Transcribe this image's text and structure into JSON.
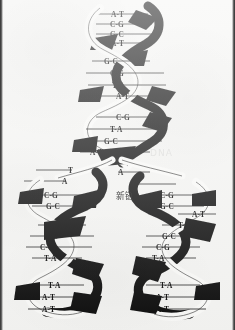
{
  "figure": {
    "kind": "scanned-illustration",
    "background_color": "#f5f5f3",
    "ink_color": "#0d0d0d",
    "strand_light_color": "#fbfbf9",
    "labels": {
      "new_strand": "新链",
      "watermark": "DNA"
    }
  },
  "helix": {
    "parent": {
      "name": "parent-duplex",
      "segments": [
        {
          "name": "parent-segment-1",
          "pairs": [
            "A-T",
            "C-G",
            "G-C",
            "A-T"
          ]
        },
        {
          "name": "parent-segment-2",
          "pairs": [
            "G-C",
            "C-G",
            "T-A",
            "A-T"
          ]
        },
        {
          "name": "parent-segment-3",
          "pairs": [
            "C-G",
            "T-A",
            "G-C",
            "A-T"
          ]
        }
      ]
    },
    "fork": {
      "name": "replication-fork",
      "unpaired_left": [
        "T",
        "A"
      ],
      "unpaired_right": [
        "A",
        "T"
      ]
    },
    "daughter_left": {
      "name": "daughter-duplex-left",
      "segments": [
        {
          "name": "left-segment-1",
          "pairs": [
            "C-G",
            "G-C"
          ]
        },
        {
          "name": "left-segment-2",
          "pairs": [
            "T-A",
            "G-C",
            "C-G",
            "T-A"
          ]
        },
        {
          "name": "left-segment-3",
          "pairs": [
            "T-A",
            "A-T",
            "A-T"
          ]
        }
      ]
    },
    "daughter_right": {
      "name": "daughter-duplex-right",
      "segments": [
        {
          "name": "right-segment-1",
          "pairs": [
            "C-G",
            "G-C"
          ]
        },
        {
          "name": "right-segment-2",
          "pairs": [
            "A-T",
            "T-A",
            "G-C",
            "C-G",
            "T-A"
          ]
        },
        {
          "name": "right-segment-3",
          "pairs": [
            "T-A",
            "A-T",
            "A-T"
          ]
        }
      ]
    }
  },
  "bases": {
    "p_s1_0": "A-T",
    "p_s1_1": "C-G",
    "p_s1_2": "G-C",
    "p_s1_3": "A-T",
    "p_s2_0": "G-C",
    "p_s2_1": "C-G",
    "p_s2_2": "T-A",
    "p_s2_3": "A-T",
    "p_s3_0": "C-G",
    "p_s3_1": "T-A",
    "p_s3_2": "G-C",
    "p_s3_3": "A-T",
    "fork_l0": "T",
    "fork_l1": "A",
    "fork_r0": "A",
    "fork_r1": "T",
    "l_s1_0": "C-G",
    "l_s1_1": "G-C",
    "l_s2_0": "T-A",
    "l_s2_1": "G-C",
    "l_s2_2": "C-G",
    "l_s2_3": "T-A",
    "l_s3_0": "T-A",
    "l_s3_1": "A-T",
    "l_s3_2": "A-T",
    "r_s1_0": "C-G",
    "r_s1_1": "G-C",
    "r_s2_0": "A-T",
    "r_s2_1": "T-A",
    "r_s2_2": "G-C",
    "r_s2_3": "C-G",
    "r_s2_4": "T-A",
    "r_s3_0": "T-A",
    "r_s3_1": "A-T",
    "r_s3_2": "A-T"
  }
}
